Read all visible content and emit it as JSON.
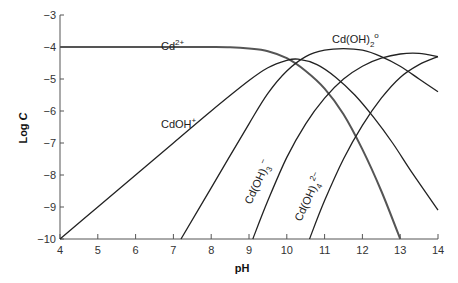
{
  "chart_data": {
    "type": "line",
    "title": "",
    "xlabel": "pH",
    "ylabel": "Log C",
    "xlim": [
      4,
      14
    ],
    "ylim": [
      -10,
      -3
    ],
    "xticks": [
      4,
      5,
      6,
      7,
      8,
      9,
      10,
      11,
      12,
      13,
      14
    ],
    "yticks": [
      -3,
      -4,
      -5,
      -6,
      -7,
      -8,
      -9,
      -10
    ],
    "grid": false,
    "legend": "inline labels",
    "series": [
      {
        "name": "Cd2+",
        "label_main": "Cd",
        "label_sup": "2+",
        "label_sub": "",
        "x": [
          4,
          5,
          6,
          7,
          8,
          8.5,
          9,
          9.5,
          10,
          10.5,
          11,
          11.5,
          12,
          12.5,
          13
        ],
        "y": [
          -4,
          -4,
          -4,
          -4,
          -4,
          -4.01,
          -4.05,
          -4.13,
          -4.35,
          -4.75,
          -5.3,
          -6.1,
          -7.2,
          -8.5,
          -10
        ]
      },
      {
        "name": "CdOH+",
        "label_main": "CdOH",
        "label_sup": "+",
        "label_sub": "",
        "x": [
          4,
          5,
          6,
          7,
          8,
          9,
          9.5,
          10,
          10.3,
          10.8,
          11.3,
          11.8,
          12.3,
          12.8,
          13.3,
          14
        ],
        "y": [
          -10,
          -9,
          -8,
          -7,
          -6,
          -5.05,
          -4.65,
          -4.42,
          -4.38,
          -4.55,
          -4.95,
          -5.5,
          -6.2,
          -7,
          -7.9,
          -9.1
        ]
      },
      {
        "name": "Cd(OH)2°",
        "label_main": "Cd(OH)",
        "label_sup": "o",
        "label_sub": "2",
        "x": [
          7.2,
          8,
          9,
          9.5,
          10,
          10.5,
          11,
          11.5,
          12,
          12.5,
          13,
          13.5,
          14
        ],
        "y": [
          -10,
          -8.4,
          -6.4,
          -5.45,
          -4.75,
          -4.3,
          -4.1,
          -4.05,
          -4.1,
          -4.3,
          -4.6,
          -5,
          -5.4
        ]
      },
      {
        "name": "Cd(OH)3-",
        "label_main": "Cd(OH)",
        "label_sup": "−",
        "label_sub": "3",
        "x": [
          9.1,
          9.5,
          10,
          10.5,
          11,
          11.5,
          12,
          12.5,
          13,
          13.5,
          14
        ],
        "y": [
          -10,
          -8.8,
          -7.45,
          -6.4,
          -5.6,
          -5.0,
          -4.6,
          -4.35,
          -4.22,
          -4.2,
          -4.3
        ]
      },
      {
        "name": "Cd(OH)4 2-",
        "label_main": "Cd(OH)",
        "label_sup": "2−",
        "label_sub": "4",
        "x": [
          10.6,
          11,
          11.5,
          12,
          12.5,
          13,
          13.5,
          14
        ],
        "y": [
          -10,
          -8.8,
          -7.5,
          -6.45,
          -5.6,
          -4.95,
          -4.55,
          -4.3
        ]
      }
    ]
  },
  "axes": {
    "xlabel": "pH",
    "ylabel_main": "Log ",
    "ylabel_var": "C",
    "xtick_labels": [
      "4",
      "5",
      "6",
      "7",
      "8",
      "9",
      "10",
      "11",
      "12",
      "13",
      "14"
    ],
    "ytick_labels": [
      "−3",
      "−4",
      "−5",
      "−6",
      "−7",
      "−8",
      "−9",
      "−10"
    ]
  },
  "labels": {
    "cd2": {
      "main": "Cd",
      "sup": "2+"
    },
    "cdoh": {
      "main": "CdOH",
      "sup": "+"
    },
    "cdoh2": {
      "main": "Cd(OH)",
      "sub": "2",
      "sup": "o"
    },
    "cdoh3": {
      "main": "Cd(OH)",
      "sub": "3",
      "sup": "−"
    },
    "cdoh4": {
      "main": "Cd(OH)",
      "sub": "4",
      "sup": "2−"
    }
  }
}
